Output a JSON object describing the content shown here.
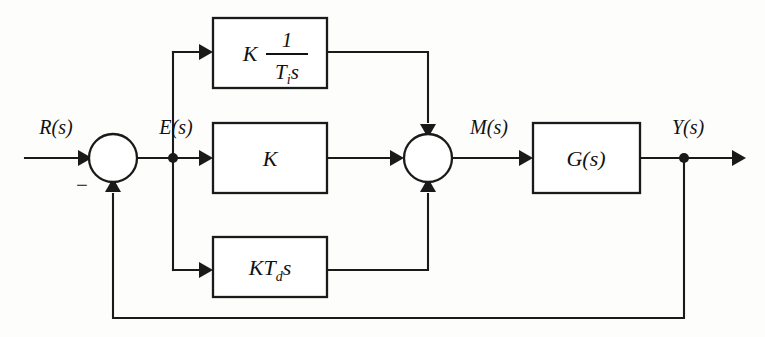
{
  "diagram": {
    "type": "control-system-block-diagram",
    "background_color": "#fdfdfc",
    "line_color": "#1a1a1a",
    "signals": {
      "reference": "R(s)",
      "error": "E(s)",
      "manipulated": "M(s)",
      "output": "Y(s)"
    },
    "summing_junction_1": {
      "negative_sign": "−",
      "positive_input": "R(s)",
      "negative_input": "Y(s)",
      "output": "E(s)"
    },
    "blocks": {
      "integral": {
        "gain": "K",
        "numerator": "1",
        "denominator_main": "T",
        "denominator_subscript": "i",
        "denominator_var": "s"
      },
      "proportional": {
        "label": "K"
      },
      "derivative": {
        "gain": "KT",
        "subscript": "d",
        "variable": "s"
      },
      "plant": {
        "label": "G(s)"
      }
    },
    "paths": {
      "feedback_label": "",
      "takeoff_node": "Y(s)"
    }
  }
}
